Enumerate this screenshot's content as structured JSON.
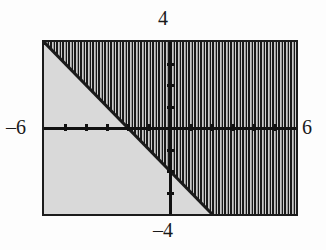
{
  "figure": {
    "title": "",
    "background_color": "#fdfdfd",
    "plot_background_color": "#d9d9d9",
    "frame_color": "#1c1c1c",
    "axis_color": "#111111",
    "hatch_color": "#1a1a1a"
  },
  "labels": {
    "top": "4",
    "bottom": "–4",
    "left": "–6",
    "right": "6"
  },
  "chart_data": {
    "type": "line",
    "title": "",
    "xlabel": "",
    "ylabel": "",
    "xlim": [
      -6,
      6
    ],
    "ylim": [
      -4,
      4
    ],
    "grid": false,
    "legend": false,
    "axis_tick_labels": {
      "x_min": "–6",
      "x_max": "6",
      "y_min": "–4",
      "y_max": "4"
    },
    "x_ticks": [
      -5,
      -4,
      -3,
      -2,
      -1,
      1,
      2,
      3,
      4,
      5
    ],
    "y_ticks": [
      -3,
      -2,
      -1,
      1,
      2,
      3
    ],
    "series": [
      {
        "name": "boundary line",
        "kind": "line",
        "style": "solid",
        "color": "#1a1a1a",
        "equation": "y = -x - 2",
        "slope": -1,
        "intercept": -2,
        "x": [
          -6,
          2
        ],
        "y": [
          4,
          -4
        ]
      }
    ],
    "shaded_region": {
      "name": "solution region",
      "inequality": "y ≥ -x - 2",
      "side": "above",
      "fill": "vertical-hatch",
      "hatch_color": "#1a1a1a",
      "hatch_spacing_px": 6
    },
    "annotations": []
  }
}
